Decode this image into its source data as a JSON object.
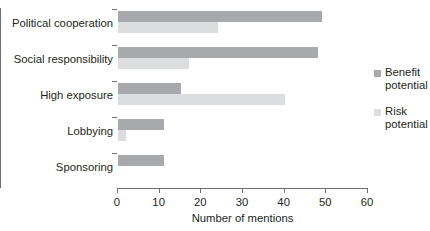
{
  "chart_data": {
    "type": "bar",
    "orientation": "horizontal",
    "title": "",
    "xlabel": "Number of mentions",
    "ylabel": "",
    "xlim": [
      0,
      60
    ],
    "xticks": [
      0,
      10,
      20,
      30,
      40,
      50,
      60
    ],
    "grid": false,
    "legend_position": "right",
    "categories": [
      "Political cooperation",
      "Social responsibility",
      "High exposure",
      "Lobbying",
      "Sponsoring"
    ],
    "series": [
      {
        "name": "Benefit potential",
        "color": "#a7a9ac",
        "values": [
          49,
          48,
          15,
          11,
          11
        ]
      },
      {
        "name": "Risk potential",
        "color": "#dcdddf",
        "values": [
          24,
          17,
          40,
          2,
          0
        ]
      }
    ]
  },
  "legend": {
    "items": [
      {
        "label_line1": "Benefit",
        "label_line2": "potential"
      },
      {
        "label_line1": "Risk",
        "label_line2": "potential"
      }
    ]
  }
}
